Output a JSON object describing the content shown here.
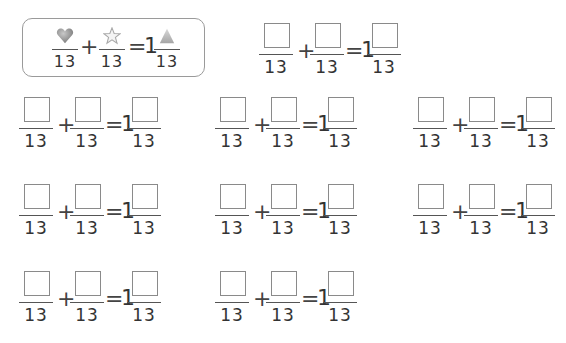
{
  "example": {
    "numerators": [
      "heart-icon",
      "star-icon",
      "triangle-icon"
    ],
    "denominator": "13",
    "plus": "+",
    "equals": "=",
    "whole": "1"
  },
  "problems": [
    {
      "d1": "13",
      "d2": "13",
      "d3": "13",
      "plus": "+",
      "equals": "=",
      "whole": "1"
    },
    {
      "d1": "13",
      "d2": "13",
      "d3": "13",
      "plus": "+",
      "equals": "=",
      "whole": "1"
    },
    {
      "d1": "13",
      "d2": "13",
      "d3": "13",
      "plus": "+",
      "equals": "=",
      "whole": "1"
    },
    {
      "d1": "13",
      "d2": "13",
      "d3": "13",
      "plus": "+",
      "equals": "=",
      "whole": "1"
    },
    {
      "d1": "13",
      "d2": "13",
      "d3": "13",
      "plus": "+",
      "equals": "=",
      "whole": "1"
    },
    {
      "d1": "13",
      "d2": "13",
      "d3": "13",
      "plus": "+",
      "equals": "=",
      "whole": "1"
    },
    {
      "d1": "13",
      "d2": "13",
      "d3": "13",
      "plus": "+",
      "equals": "=",
      "whole": "1"
    },
    {
      "d1": "13",
      "d2": "13",
      "d3": "13",
      "plus": "+",
      "equals": "=",
      "whole": "1"
    },
    {
      "d1": "13",
      "d2": "13",
      "d3": "13",
      "plus": "+",
      "equals": "=",
      "whole": "1"
    }
  ]
}
